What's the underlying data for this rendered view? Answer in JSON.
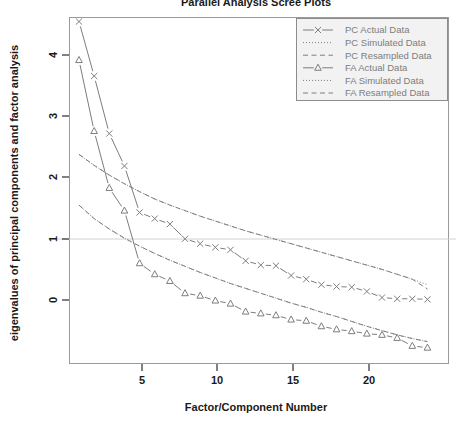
{
  "chart_data": {
    "type": "line",
    "title": "Parallel Analysis Scree Plots",
    "xlabel": "Factor/Component Number",
    "ylabel": "eigenvalues of principal components and factor analysis",
    "xlim": [
      1,
      24
    ],
    "ylim": [
      -0.85,
      4.65
    ],
    "xticks": [
      5,
      10,
      15,
      20
    ],
    "yticks": [
      0,
      1,
      2,
      3,
      4
    ],
    "grid": false,
    "hline": 1,
    "legend_position": "top-right",
    "x": [
      1,
      2,
      3,
      4,
      5,
      6,
      7,
      8,
      9,
      10,
      11,
      12,
      13,
      14,
      15,
      16,
      17,
      18,
      19,
      20,
      21,
      22,
      23,
      24
    ],
    "series": [
      {
        "name": "PC  Actual Data",
        "marker": "x",
        "linestyle": "solid",
        "values": [
          4.55,
          3.66,
          2.72,
          2.19,
          1.43,
          1.33,
          1.24,
          1.0,
          0.92,
          0.86,
          0.82,
          0.64,
          0.57,
          0.56,
          0.4,
          0.34,
          0.25,
          0.22,
          0.21,
          0.14,
          0.04,
          0.02,
          0.02,
          0.01
        ]
      },
      {
        "name": "PC  Simulated Data",
        "marker": "none",
        "linestyle": "dotted",
        "values": [
          2.38,
          2.2,
          2.04,
          1.9,
          1.77,
          1.65,
          1.55,
          1.46,
          1.37,
          1.29,
          1.21,
          1.13,
          1.06,
          0.99,
          0.92,
          0.85,
          0.78,
          0.71,
          0.64,
          0.57,
          0.5,
          0.42,
          0.34,
          0.25
        ]
      },
      {
        "name": "PC  Resampled Data",
        "marker": "none",
        "linestyle": "dashed",
        "values": [
          2.38,
          2.2,
          2.04,
          1.9,
          1.77,
          1.65,
          1.55,
          1.46,
          1.37,
          1.29,
          1.21,
          1.13,
          1.06,
          0.99,
          0.92,
          0.85,
          0.78,
          0.71,
          0.64,
          0.57,
          0.5,
          0.42,
          0.34,
          0.18
        ]
      },
      {
        "name": "FA  Actual Data",
        "marker": "triangle",
        "linestyle": "solid",
        "values": [
          3.92,
          2.76,
          1.83,
          1.46,
          0.6,
          0.42,
          0.31,
          0.11,
          0.07,
          -0.01,
          -0.06,
          -0.19,
          -0.22,
          -0.25,
          -0.32,
          -0.34,
          -0.43,
          -0.48,
          -0.51,
          -0.55,
          -0.57,
          -0.62,
          -0.75,
          -0.78
        ]
      },
      {
        "name": "FA  Simulated Data",
        "marker": "none",
        "linestyle": "dotted",
        "values": [
          1.55,
          1.33,
          1.16,
          1.01,
          0.88,
          0.76,
          0.65,
          0.55,
          0.45,
          0.36,
          0.27,
          0.19,
          0.11,
          0.03,
          -0.05,
          -0.12,
          -0.2,
          -0.27,
          -0.35,
          -0.43,
          -0.5,
          -0.57,
          -0.63,
          -0.68
        ]
      },
      {
        "name": "FA  Resampled Data",
        "marker": "none",
        "linestyle": "dashed",
        "values": [
          1.55,
          1.33,
          1.16,
          1.01,
          0.88,
          0.76,
          0.65,
          0.55,
          0.45,
          0.36,
          0.27,
          0.19,
          0.11,
          0.03,
          -0.05,
          -0.12,
          -0.2,
          -0.27,
          -0.35,
          -0.43,
          -0.5,
          -0.57,
          -0.63,
          -0.68
        ]
      }
    ]
  },
  "axes": {
    "x_title": "Factor/Component Number",
    "y_title": "eigenvalues of principal components and factor analysis",
    "x_tick_labels": [
      "5",
      "10",
      "15",
      "20"
    ],
    "y_tick_labels": [
      "0",
      "1",
      "2",
      "3",
      "4"
    ]
  },
  "legend": {
    "entries": [
      {
        "label": "PC  Actual Data",
        "style": "solid-x"
      },
      {
        "label": "PC  Simulated Data",
        "style": "dotted"
      },
      {
        "label": "PC  Resampled Data",
        "style": "dashed"
      },
      {
        "label": "FA  Actual Data",
        "style": "solid-triangle"
      },
      {
        "label": "FA  Simulated Data",
        "style": "dotted"
      },
      {
        "label": "FA  Resampled Data",
        "style": "dashed"
      }
    ]
  },
  "title": {
    "text": "Parallel Analysis Scree Plots"
  },
  "colors": {
    "line": "#7d7d7d",
    "frame": "#9a9a9a",
    "text": "#1a1a1a",
    "legend_bg": "#f2f2f2",
    "legend_border": "#8c8c8c",
    "hline": "#cfcfcf"
  }
}
